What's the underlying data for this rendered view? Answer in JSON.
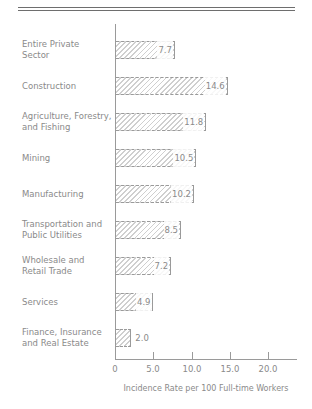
{
  "chart_data": {
    "type": "bar",
    "orientation": "horizontal",
    "title": "",
    "xlabel": "Incidence Rate per 100 Full-time Workers",
    "ylabel": "",
    "xlim": [
      0,
      23.5
    ],
    "x_ticks": [
      "0",
      "5.0",
      "10.0",
      "15.0",
      "20.0"
    ],
    "grid": false,
    "legend": null,
    "categories": [
      "Entire Private Sector",
      "Construction",
      "Agriculture, Forestry, and Fishing",
      "Mining",
      "Manufacturing",
      "Transportation and Public Utilities",
      "Wholesale and Retail Trade",
      "Services",
      "Finance, Insurance and Real Estate"
    ],
    "values": [
      7.7,
      14.6,
      11.8,
      10.5,
      10.2,
      8.5,
      7.2,
      4.9,
      2.0
    ],
    "value_labels": [
      "7.7",
      "14.6",
      "11.8",
      "10.5",
      "10.2",
      "8.5",
      "7.2",
      "4.9",
      "2.0"
    ],
    "label_lines": [
      [
        "Entire Private",
        "Sector"
      ],
      [
        "Construction"
      ],
      [
        "Agriculture, Forestry,",
        "and Fishing"
      ],
      [
        "Mining"
      ],
      [
        "Manufacturing"
      ],
      [
        "Transportation and",
        "Public Utilities"
      ],
      [
        "Wholesale and",
        "Retail Trade"
      ],
      [
        "Services"
      ],
      [
        "Finance, Insurance",
        "and Real Estate"
      ]
    ],
    "colors": {
      "bar_hatch": "#cfcfcf",
      "bar_border": "#9a9a9a",
      "text": "#8a8a8a",
      "rule": "#6e6e6e"
    }
  }
}
